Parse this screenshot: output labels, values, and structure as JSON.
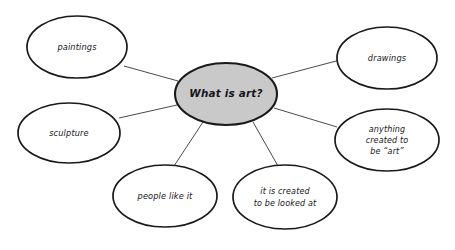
{
  "diagram": {
    "type": "mind-map",
    "title": "What is art?",
    "background_color": "#ffffff",
    "central_node": {
      "id": "central",
      "label": "What is art?",
      "fill_color": "#c9c9c9",
      "stroke_color": "#1a1a1a",
      "cx": 226,
      "cy": 94,
      "rx": 51,
      "ry": 31
    },
    "branch_nodes": [
      {
        "id": "paintings",
        "label": "paintings",
        "lines": [
          "paintings"
        ],
        "fill_color": "#ffffff",
        "stroke_color": "#1a1a1a",
        "cx": 77,
        "cy": 47,
        "rx": 50,
        "ry": 31
      },
      {
        "id": "drawings",
        "label": "drawings",
        "lines": [
          "drawings"
        ],
        "fill_color": "#ffffff",
        "stroke_color": "#1a1a1a",
        "cx": 387,
        "cy": 58,
        "rx": 50,
        "ry": 31
      },
      {
        "id": "sculpture",
        "label": "sculpture",
        "lines": [
          "sculpture"
        ],
        "fill_color": "#ffffff",
        "stroke_color": "#1a1a1a",
        "cx": 69,
        "cy": 133,
        "rx": 51,
        "ry": 30
      },
      {
        "id": "anything-created-to-be-art",
        "label": "anything created to be “art”",
        "lines": [
          "anything",
          "created to",
          "be “art”"
        ],
        "fill_color": "#ffffff",
        "stroke_color": "#1a1a1a",
        "cx": 387,
        "cy": 140,
        "rx": 52,
        "ry": 31
      },
      {
        "id": "people-like-it",
        "label": "people like it",
        "lines": [
          "people like it"
        ],
        "fill_color": "#ffffff",
        "stroke_color": "#1a1a1a",
        "cx": 165,
        "cy": 196,
        "rx": 52,
        "ry": 31
      },
      {
        "id": "it-is-created-to-be-looked-at",
        "label": "it is created to be looked at",
        "lines": [
          "it is created",
          "to be looked at"
        ],
        "fill_color": "#ffffff",
        "stroke_color": "#1a1a1a",
        "cx": 285,
        "cy": 197,
        "rx": 52,
        "ry": 32
      }
    ],
    "edges": [
      {
        "id": "edge-central-paintings",
        "from": "central",
        "to": "paintings",
        "x1": 178,
        "y1": 81,
        "x2": 124,
        "y2": 66
      },
      {
        "id": "edge-central-drawings",
        "from": "central",
        "to": "drawings",
        "x1": 272,
        "y1": 78,
        "x2": 340,
        "y2": 60
      },
      {
        "id": "edge-central-sculpture",
        "from": "central",
        "to": "sculpture",
        "x1": 177,
        "y1": 105,
        "x2": 119,
        "y2": 118
      },
      {
        "id": "edge-central-anything",
        "from": "central",
        "to": "anything-created-to-be-art",
        "x1": 274,
        "y1": 108,
        "x2": 337,
        "y2": 127
      },
      {
        "id": "edge-central-people-like-it",
        "from": "central",
        "to": "people-like-it",
        "x1": 203,
        "y1": 122,
        "x2": 174,
        "y2": 166
      },
      {
        "id": "edge-central-it-is-created",
        "from": "central",
        "to": "it-is-created-to-be-looked-at",
        "x1": 253,
        "y1": 122,
        "x2": 278,
        "y2": 166
      }
    ]
  }
}
